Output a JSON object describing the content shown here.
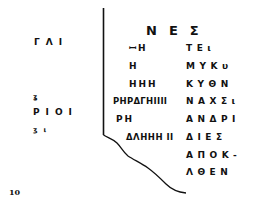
{
  "document": {
    "page_number": "10",
    "heading": "ΝΕΣ",
    "left_column": [
      {
        "text": "ΓΛΙ"
      },
      {
        "text": "ʓ"
      },
      {
        "text": "ΡΙΟΙ"
      },
      {
        "text": "ʒι"
      }
    ],
    "inner_column": [
      {
        "text": "ꟷH"
      },
      {
        "text": "H"
      },
      {
        "text": "HHH"
      },
      {
        "text": "ΡΗΡΔΓΗIIII"
      },
      {
        "text": "ΡΗ"
      },
      {
        "text": "ΔΛΗΗΗ II"
      }
    ],
    "right_column": [
      {
        "text": "ΤΕι"
      },
      {
        "text": "ΜΥΚυ"
      },
      {
        "text": "ΚΥΘΝ"
      },
      {
        "text": "ΝΑΧΣι"
      },
      {
        "text": "ΑΝΔΡΙ"
      },
      {
        "text": "ΔΙΕΣ"
      },
      {
        "text": "ΑΠΟΚ-"
      },
      {
        "text": "ΛΘΕΝ"
      }
    ],
    "colors": {
      "ink": "#111111",
      "paper": "#ffffff"
    }
  }
}
